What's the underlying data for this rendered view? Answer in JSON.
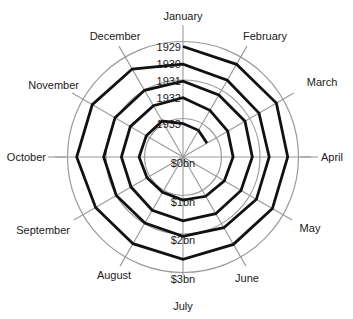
{
  "chart_data": {
    "type": "line",
    "subtype": "polar-spiral",
    "title": "",
    "months": [
      "January",
      "February",
      "March",
      "April",
      "May",
      "June",
      "July",
      "August",
      "September",
      "October",
      "November",
      "December"
    ],
    "years": [
      "1929",
      "1930",
      "1931",
      "1932",
      "1933"
    ],
    "radial_axis": {
      "labels": [
        "$0bn",
        "$1bn",
        "$2bn",
        "$3bn"
      ],
      "values": [
        0,
        1,
        2,
        3
      ],
      "range": [
        0,
        3
      ],
      "unit": "$bn"
    },
    "grid": true,
    "series": [
      {
        "name": "1929",
        "values": [
          2.87,
          2.78,
          2.8,
          2.72,
          2.68,
          2.62,
          2.66,
          2.6,
          2.62,
          2.76,
          2.72,
          2.64
        ]
      },
      {
        "name": "1930",
        "values": [
          2.41,
          2.3,
          2.28,
          2.24,
          2.2,
          2.12,
          2.06,
          1.98,
          2.0,
          2.06,
          2.04,
          2.0
        ]
      },
      {
        "name": "1931",
        "values": [
          1.97,
          1.86,
          1.86,
          1.8,
          1.74,
          1.7,
          1.66,
          1.6,
          1.56,
          1.6,
          1.58,
          1.54
        ]
      },
      {
        "name": "1932",
        "values": [
          1.54,
          1.4,
          1.34,
          1.3,
          1.24,
          1.18,
          1.12,
          1.06,
          1.08,
          1.14,
          1.1,
          1.08
        ]
      },
      {
        "name": "1933",
        "values": [
          0.87,
          0.8,
          0.72
        ]
      }
    ]
  },
  "labels": {
    "months": [
      "January",
      "February",
      "March",
      "April",
      "May",
      "June",
      "July",
      "August",
      "September",
      "October",
      "November",
      "December"
    ],
    "years": [
      "1929",
      "1930",
      "1931",
      "1932",
      "1933"
    ],
    "radial": [
      "$0bn",
      "$1bn",
      "$2bn",
      "$3bn"
    ]
  },
  "colors": {
    "spiral": "#111111",
    "grid": "#9a9a9a",
    "text": "#1a1a1a",
    "background": "#ffffff"
  }
}
